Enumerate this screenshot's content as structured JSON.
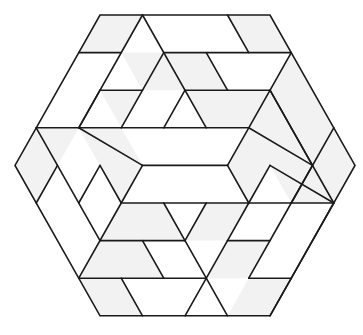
{
  "figure": {
    "lattice": {
      "origin_x": 15,
      "origin_y": 15,
      "dx": 21.25,
      "dy": 37.6
    },
    "colors": {
      "line": "#1a1a1a",
      "shaded": "#f2f2f2",
      "background": "#ffffff"
    },
    "outline": [
      [
        4,
        0
      ],
      [
        12,
        0
      ],
      [
        16,
        4
      ],
      [
        12,
        8
      ],
      [
        4,
        8
      ],
      [
        0,
        4
      ]
    ],
    "shaded_tiles": [
      [
        [
          4,
          0
        ],
        [
          6,
          0
        ],
        [
          5,
          1
        ],
        [
          3,
          1
        ]
      ],
      [
        [
          10,
          0
        ],
        [
          12,
          0
        ],
        [
          13,
          1
        ],
        [
          11,
          1
        ]
      ],
      [
        [
          6,
          0
        ],
        [
          8,
          2
        ],
        [
          6,
          2
        ],
        [
          7,
          1
        ]
      ],
      [
        [
          7,
          1
        ],
        [
          9,
          1
        ],
        [
          10,
          2
        ],
        [
          8,
          2
        ]
      ],
      [
        [
          5,
          1
        ],
        [
          7,
          1
        ],
        [
          5,
          3
        ],
        [
          4,
          2
        ],
        [
          6,
          2
        ]
      ],
      [
        [
          9,
          3
        ],
        [
          11,
          3
        ],
        [
          12,
          2
        ],
        [
          8,
          2
        ]
      ],
      [
        [
          12,
          2
        ],
        [
          13,
          1
        ],
        [
          15,
          3
        ],
        [
          14,
          4
        ],
        [
          13,
          3
        ]
      ],
      [
        [
          1,
          3
        ],
        [
          3,
          3
        ],
        [
          2,
          4
        ],
        [
          0,
          4
        ]
      ],
      [
        [
          3,
          3
        ],
        [
          5,
          3
        ],
        [
          6,
          4
        ],
        [
          5,
          5
        ],
        [
          4,
          4
        ]
      ],
      [
        [
          1,
          3
        ],
        [
          2,
          4
        ],
        [
          1,
          5
        ],
        [
          0,
          4
        ]
      ],
      [
        [
          12,
          2
        ],
        [
          13,
          3
        ],
        [
          11,
          5
        ],
        [
          10,
          4
        ],
        [
          11,
          3
        ]
      ],
      [
        [
          14,
          4
        ],
        [
          15,
          3
        ],
        [
          16,
          4
        ],
        [
          15,
          5
        ]
      ],
      [
        [
          13,
          3
        ],
        [
          15,
          5
        ],
        [
          13,
          5
        ],
        [
          12,
          4
        ]
      ],
      [
        [
          5,
          5
        ],
        [
          7,
          5
        ],
        [
          8,
          6
        ],
        [
          4,
          6
        ]
      ],
      [
        [
          4,
          6
        ],
        [
          6,
          6
        ],
        [
          7,
          7
        ],
        [
          3,
          7
        ]
      ],
      [
        [
          3,
          7
        ],
        [
          5,
          7
        ],
        [
          6,
          8
        ],
        [
          4,
          8
        ]
      ],
      [
        [
          9,
          5
        ],
        [
          11,
          5
        ],
        [
          10,
          6
        ],
        [
          8,
          6
        ]
      ],
      [
        [
          10,
          6
        ],
        [
          12,
          6
        ],
        [
          11,
          7
        ],
        [
          9,
          7
        ],
        [
          8,
          8
        ]
      ],
      [
        [
          11,
          7
        ],
        [
          13,
          7
        ],
        [
          12,
          8
        ],
        [
          10,
          8
        ]
      ]
    ],
    "edges": [
      [
        [
          3,
          1
        ],
        [
          5,
          1
        ]
      ],
      [
        [
          7,
          1
        ],
        [
          13,
          1
        ]
      ],
      [
        [
          4,
          2
        ],
        [
          6,
          2
        ]
      ],
      [
        [
          8,
          2
        ],
        [
          12,
          2
        ]
      ],
      [
        [
          1,
          3
        ],
        [
          11,
          3
        ]
      ],
      [
        [
          6,
          4
        ],
        [
          10,
          4
        ]
      ],
      [
        [
          5,
          5
        ],
        [
          15,
          5
        ]
      ],
      [
        [
          4,
          6
        ],
        [
          8,
          6
        ]
      ],
      [
        [
          10,
          6
        ],
        [
          12,
          6
        ]
      ],
      [
        [
          3,
          7
        ],
        [
          9,
          7
        ]
      ],
      [
        [
          11,
          7
        ],
        [
          13,
          7
        ]
      ],
      [
        [
          6,
          0
        ],
        [
          3,
          3
        ]
      ],
      [
        [
          7,
          1
        ],
        [
          5,
          3
        ]
      ],
      [
        [
          4,
          2
        ],
        [
          3,
          3
        ]
      ],
      [
        [
          8,
          2
        ],
        [
          7,
          3
        ]
      ],
      [
        [
          13,
          1
        ],
        [
          11,
          3
        ]
      ],
      [
        [
          6,
          4
        ],
        [
          5,
          5
        ]
      ],
      [
        [
          10,
          4
        ],
        [
          11,
          3
        ]
      ],
      [
        [
          2,
          4
        ],
        [
          1,
          5
        ]
      ],
      [
        [
          4,
          4
        ],
        [
          3,
          5
        ]
      ],
      [
        [
          5,
          5
        ],
        [
          3,
          7
        ]
      ],
      [
        [
          15,
          3
        ],
        [
          13,
          5
        ]
      ],
      [
        [
          14,
          4
        ],
        [
          13,
          5
        ]
      ],
      [
        [
          11,
          5
        ],
        [
          10,
          6
        ]
      ],
      [
        [
          9,
          5
        ],
        [
          8,
          6
        ]
      ],
      [
        [
          12,
          4
        ],
        [
          11,
          5
        ]
      ],
      [
        [
          10,
          6
        ],
        [
          8,
          8
        ]
      ],
      [
        [
          13,
          5
        ],
        [
          11,
          7
        ]
      ],
      [
        [
          15,
          5
        ],
        [
          12,
          8
        ]
      ],
      [
        [
          10,
          0
        ],
        [
          11,
          1
        ]
      ],
      [
        [
          6,
          0
        ],
        [
          9,
          3
        ]
      ],
      [
        [
          9,
          1
        ],
        [
          10,
          2
        ]
      ],
      [
        [
          12,
          2
        ],
        [
          14,
          4
        ]
      ],
      [
        [
          12,
          2
        ],
        [
          13,
          3
        ]
      ],
      [
        [
          1,
          3
        ],
        [
          4,
          6
        ]
      ],
      [
        [
          3,
          3
        ],
        [
          6,
          4
        ]
      ],
      [
        [
          4,
          4
        ],
        [
          5,
          5
        ]
      ],
      [
        [
          10,
          4
        ],
        [
          11,
          5
        ]
      ],
      [
        [
          11,
          3
        ],
        [
          14,
          4
        ]
      ],
      [
        [
          7,
          5
        ],
        [
          8,
          6
        ]
      ],
      [
        [
          6,
          6
        ],
        [
          7,
          7
        ]
      ],
      [
        [
          5,
          7
        ],
        [
          6,
          8
        ]
      ],
      [
        [
          8,
          6
        ],
        [
          9,
          7
        ]
      ],
      [
        [
          12,
          4
        ],
        [
          15,
          5
        ]
      ],
      [
        [
          13,
          3
        ],
        [
          15,
          5
        ]
      ],
      [
        [
          9,
          7
        ],
        [
          10,
          8
        ]
      ]
    ]
  }
}
